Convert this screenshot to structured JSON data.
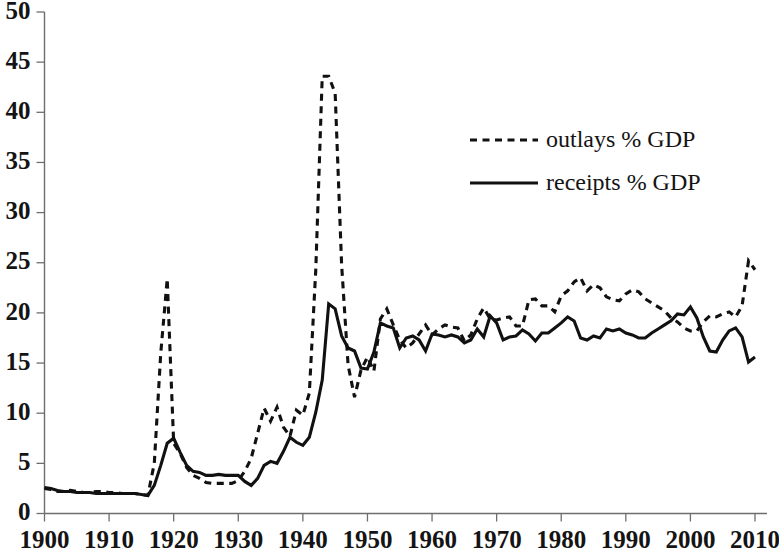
{
  "chart_data": {
    "type": "line",
    "title": "",
    "subtitle": "",
    "xlabel": "",
    "ylabel": "",
    "xlim": [
      1900,
      2010
    ],
    "ylim": [
      0,
      50
    ],
    "grid": false,
    "legend_position": "center-right",
    "x_ticks": [
      1900,
      1910,
      1920,
      1930,
      1940,
      1950,
      1960,
      1970,
      1980,
      1990,
      2000,
      2010
    ],
    "y_ticks": [
      0,
      5,
      10,
      15,
      20,
      25,
      30,
      35,
      40,
      45,
      50
    ],
    "x": [
      1900,
      1901,
      1902,
      1903,
      1904,
      1905,
      1906,
      1907,
      1908,
      1909,
      1910,
      1911,
      1912,
      1913,
      1914,
      1915,
      1916,
      1917,
      1918,
      1919,
      1920,
      1921,
      1922,
      1923,
      1924,
      1925,
      1926,
      1927,
      1928,
      1929,
      1930,
      1931,
      1932,
      1933,
      1934,
      1935,
      1936,
      1937,
      1938,
      1939,
      1940,
      1941,
      1942,
      1943,
      1944,
      1945,
      1946,
      1947,
      1948,
      1949,
      1950,
      1951,
      1952,
      1953,
      1954,
      1955,
      1956,
      1957,
      1958,
      1959,
      1960,
      1961,
      1962,
      1963,
      1964,
      1965,
      1966,
      1967,
      1968,
      1969,
      1970,
      1971,
      1972,
      1973,
      1974,
      1975,
      1976,
      1977,
      1978,
      1979,
      1980,
      1981,
      1982,
      1983,
      1984,
      1985,
      1986,
      1987,
      1988,
      1989,
      1990,
      1991,
      1992,
      1993,
      1994,
      1995,
      1996,
      1997,
      1998,
      1999,
      2000,
      2001,
      2002,
      2003,
      2004,
      2005,
      2006,
      2007,
      2008,
      2009,
      2010
    ],
    "series": [
      {
        "name": "outlays % GDP",
        "style": "dashed",
        "color": "#111111",
        "values": [
          2.5,
          2.4,
          2.2,
          2.2,
          2.3,
          2.2,
          2.1,
          2.1,
          2.2,
          2.2,
          2.1,
          2.1,
          2.0,
          2.0,
          2.0,
          1.9,
          1.8,
          5.0,
          16.0,
          23.4,
          7.0,
          6.0,
          4.6,
          3.8,
          3.5,
          3.1,
          3.0,
          3.0,
          3.0,
          3.0,
          3.3,
          4.2,
          5.5,
          8.0,
          10.5,
          9.2,
          10.6,
          8.6,
          7.7,
          10.3,
          9.8,
          12.0,
          24.3,
          43.6,
          43.6,
          41.9,
          24.8,
          14.8,
          11.6,
          14.3,
          15.6,
          14.2,
          19.4,
          20.4,
          18.8,
          17.3,
          16.5,
          17.0,
          17.9,
          18.8,
          17.8,
          18.4,
          18.8,
          18.6,
          18.5,
          17.2,
          17.8,
          19.4,
          20.5,
          19.4,
          19.3,
          19.5,
          19.6,
          18.7,
          18.7,
          21.3,
          21.4,
          20.7,
          20.7,
          20.1,
          21.7,
          22.2,
          23.1,
          23.5,
          22.2,
          22.8,
          22.5,
          21.6,
          21.3,
          21.2,
          21.9,
          22.3,
          22.1,
          21.4,
          21.0,
          20.6,
          20.2,
          19.5,
          19.1,
          18.5,
          18.2,
          18.2,
          19.1,
          19.7,
          19.6,
          19.9,
          20.1,
          19.6,
          20.7,
          25.2,
          24.3
        ]
      },
      {
        "name": "receipts % GDP",
        "style": "solid",
        "color": "#111111",
        "values": [
          2.6,
          2.5,
          2.3,
          2.2,
          2.2,
          2.1,
          2.1,
          2.1,
          2.0,
          2.0,
          2.0,
          2.0,
          2.0,
          2.0,
          2.0,
          1.9,
          1.8,
          2.8,
          4.8,
          7.0,
          7.5,
          6.1,
          4.8,
          4.2,
          4.1,
          3.8,
          3.8,
          3.9,
          3.8,
          3.8,
          3.8,
          3.2,
          2.8,
          3.5,
          4.8,
          5.2,
          5.0,
          6.2,
          7.6,
          7.1,
          6.8,
          7.6,
          10.1,
          13.3,
          20.9,
          20.4,
          17.7,
          16.5,
          16.2,
          14.5,
          14.4,
          16.1,
          19.0,
          18.7,
          18.5,
          16.5,
          17.5,
          17.7,
          17.3,
          16.2,
          17.9,
          17.8,
          17.6,
          17.8,
          17.6,
          17.0,
          17.3,
          18.4,
          17.6,
          19.7,
          19.0,
          17.3,
          17.6,
          17.7,
          18.3,
          17.9,
          17.2,
          18.0,
          18.0,
          18.5,
          19.0,
          19.6,
          19.2,
          17.5,
          17.3,
          17.7,
          17.5,
          18.4,
          18.2,
          18.4,
          18.0,
          17.8,
          17.5,
          17.5,
          18.0,
          18.4,
          18.8,
          19.2,
          19.9,
          19.8,
          20.6,
          19.5,
          17.6,
          16.2,
          16.1,
          17.3,
          18.2,
          18.5,
          17.6,
          15.1,
          15.6
        ]
      }
    ],
    "legend_entries": [
      {
        "label": "outlays % GDP",
        "style": "dashed"
      },
      {
        "label": "receipts % GDP",
        "style": "solid"
      }
    ]
  },
  "axes": {
    "y_tick_labels": [
      "50",
      "45",
      "40",
      "35",
      "30",
      "25",
      "20",
      "15",
      "10",
      "5",
      "0"
    ],
    "x_tick_labels": [
      "1900",
      "1910",
      "1920",
      "1930",
      "1940",
      "1950",
      "1960",
      "1970",
      "1980",
      "1990",
      "2000",
      "2010"
    ]
  },
  "colors": {
    "background": "#ffffff",
    "axis": "#6e6e6e",
    "line": "#111111",
    "text": "#141414"
  }
}
